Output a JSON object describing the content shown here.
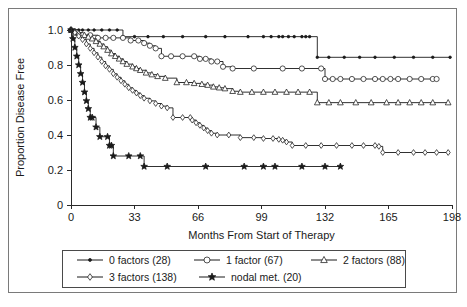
{
  "figure": {
    "name": "kaplan-meier-disease-free-survival",
    "frame_color": "#7a7a7a",
    "line_color": "#1a1a1a",
    "background": "#ffffff"
  },
  "chart_data": {
    "type": "line",
    "title": "",
    "subtitle": "",
    "xlabel": "Months From Start of Therapy",
    "ylabel": "Proportion Disease Free",
    "xlim": [
      0,
      198
    ],
    "ylim": [
      0,
      1.0
    ],
    "xticks": [
      0,
      33,
      66,
      99,
      132,
      165,
      198
    ],
    "xticklabels": [
      "0",
      "33",
      "66",
      "99",
      "132",
      "165",
      "198"
    ],
    "yticks": [
      0,
      0.2,
      0.4,
      0.6,
      0.8,
      1.0
    ],
    "yticklabels": [
      "0",
      "0.2",
      "0.4",
      "0.6",
      "0.8",
      "1.0"
    ],
    "grid": false,
    "legend_position": "below-axes",
    "step_style": "post",
    "series": [
      {
        "name": "0 factors (28)",
        "label": "0 factors",
        "n": 28,
        "marker": "dot",
        "marker_fill": "solid",
        "points": [
          [
            0,
            1.0
          ],
          [
            2,
            1.0
          ],
          [
            4,
            1.0
          ],
          [
            6,
            1.0
          ],
          [
            9,
            1.0
          ],
          [
            12,
            1.0
          ],
          [
            16,
            1.0
          ],
          [
            20,
            1.0
          ],
          [
            24,
            1.0
          ],
          [
            27,
            0.962
          ],
          [
            33,
            0.962
          ],
          [
            40,
            0.962
          ],
          [
            48,
            0.962
          ],
          [
            58,
            0.962
          ],
          [
            70,
            0.962
          ],
          [
            80,
            0.962
          ],
          [
            92,
            0.962
          ],
          [
            100,
            0.962
          ],
          [
            104,
            0.962
          ],
          [
            108,
            0.962
          ],
          [
            110,
            0.962
          ],
          [
            113,
            0.962
          ],
          [
            116,
            0.962
          ],
          [
            120,
            0.962
          ],
          [
            122,
            0.962
          ],
          [
            124,
            0.962
          ],
          [
            128,
            0.844
          ],
          [
            134,
            0.844
          ],
          [
            142,
            0.844
          ],
          [
            150,
            0.844
          ],
          [
            158,
            0.844
          ],
          [
            168,
            0.844
          ],
          [
            178,
            0.844
          ],
          [
            188,
            0.844
          ],
          [
            197,
            0.844
          ]
        ]
      },
      {
        "name": "1 factor (67)",
        "label": "1 factor",
        "n": 67,
        "marker": "circle",
        "marker_fill": "open",
        "points": [
          [
            0,
            1.0
          ],
          [
            3,
            0.985
          ],
          [
            6,
            0.97
          ],
          [
            10,
            0.97
          ],
          [
            14,
            0.955
          ],
          [
            18,
            0.955
          ],
          [
            22,
            0.955
          ],
          [
            27,
            0.955
          ],
          [
            31,
            0.94
          ],
          [
            35,
            0.94
          ],
          [
            38,
            0.925
          ],
          [
            41,
            0.91
          ],
          [
            44,
            0.895
          ],
          [
            47,
            0.85
          ],
          [
            52,
            0.85
          ],
          [
            58,
            0.85
          ],
          [
            64,
            0.85
          ],
          [
            67,
            0.835
          ],
          [
            70,
            0.835
          ],
          [
            73,
            0.82
          ],
          [
            76,
            0.82
          ],
          [
            79,
            0.79
          ],
          [
            84,
            0.78
          ],
          [
            95,
            0.78
          ],
          [
            110,
            0.78
          ],
          [
            120,
            0.78
          ],
          [
            130,
            0.78
          ],
          [
            132,
            0.72
          ],
          [
            136,
            0.72
          ],
          [
            140,
            0.72
          ],
          [
            146,
            0.72
          ],
          [
            152,
            0.72
          ],
          [
            158,
            0.72
          ],
          [
            162,
            0.72
          ],
          [
            166,
            0.72
          ],
          [
            170,
            0.72
          ],
          [
            176,
            0.72
          ],
          [
            182,
            0.72
          ],
          [
            188,
            0.72
          ],
          [
            190,
            0.72
          ]
        ]
      },
      {
        "name": "2 factors (88)",
        "label": "2 factors",
        "n": 88,
        "marker": "triangle",
        "marker_fill": "open",
        "points": [
          [
            0,
            1.0
          ],
          [
            2,
            0.99
          ],
          [
            4,
            0.98
          ],
          [
            7,
            0.97
          ],
          [
            9,
            0.96
          ],
          [
            11,
            0.95
          ],
          [
            13,
            0.935
          ],
          [
            15,
            0.92
          ],
          [
            17,
            0.905
          ],
          [
            19,
            0.885
          ],
          [
            21,
            0.865
          ],
          [
            23,
            0.85
          ],
          [
            25,
            0.835
          ],
          [
            27,
            0.82
          ],
          [
            29,
            0.805
          ],
          [
            32,
            0.79
          ],
          [
            34,
            0.78
          ],
          [
            36,
            0.77
          ],
          [
            39,
            0.755
          ],
          [
            42,
            0.745
          ],
          [
            45,
            0.735
          ],
          [
            49,
            0.725
          ],
          [
            55,
            0.7
          ],
          [
            60,
            0.7
          ],
          [
            64,
            0.695
          ],
          [
            68,
            0.69
          ],
          [
            71,
            0.685
          ],
          [
            74,
            0.675
          ],
          [
            77,
            0.67
          ],
          [
            80,
            0.665
          ],
          [
            84,
            0.65
          ],
          [
            88,
            0.645
          ],
          [
            94,
            0.645
          ],
          [
            100,
            0.645
          ],
          [
            106,
            0.645
          ],
          [
            112,
            0.645
          ],
          [
            118,
            0.645
          ],
          [
            124,
            0.645
          ],
          [
            128,
            0.585
          ],
          [
            134,
            0.585
          ],
          [
            140,
            0.585
          ],
          [
            148,
            0.585
          ],
          [
            156,
            0.585
          ],
          [
            164,
            0.585
          ],
          [
            170,
            0.585
          ],
          [
            176,
            0.585
          ],
          [
            182,
            0.585
          ],
          [
            188,
            0.585
          ],
          [
            196,
            0.585
          ]
        ]
      },
      {
        "name": "3 factors (138)",
        "label": "3 factors",
        "n": 138,
        "marker": "diamond",
        "marker_fill": "open",
        "points": [
          [
            0,
            1.0
          ],
          [
            2,
            0.985
          ],
          [
            4,
            0.965
          ],
          [
            6,
            0.945
          ],
          [
            8,
            0.92
          ],
          [
            10,
            0.895
          ],
          [
            12,
            0.87
          ],
          [
            14,
            0.845
          ],
          [
            16,
            0.82
          ],
          [
            18,
            0.795
          ],
          [
            20,
            0.775
          ],
          [
            22,
            0.75
          ],
          [
            24,
            0.73
          ],
          [
            26,
            0.71
          ],
          [
            28,
            0.69
          ],
          [
            30,
            0.67
          ],
          [
            32,
            0.655
          ],
          [
            34,
            0.64
          ],
          [
            36,
            0.625
          ],
          [
            38,
            0.61
          ],
          [
            41,
            0.595
          ],
          [
            44,
            0.58
          ],
          [
            47,
            0.565
          ],
          [
            50,
            0.555
          ],
          [
            53,
            0.5
          ],
          [
            58,
            0.5
          ],
          [
            62,
            0.5
          ],
          [
            63,
            0.485
          ],
          [
            65,
            0.47
          ],
          [
            67,
            0.455
          ],
          [
            69,
            0.44
          ],
          [
            71,
            0.425
          ],
          [
            73,
            0.41
          ],
          [
            76,
            0.4
          ],
          [
            82,
            0.4
          ],
          [
            88,
            0.385
          ],
          [
            95,
            0.385
          ],
          [
            100,
            0.38
          ],
          [
            105,
            0.38
          ],
          [
            108,
            0.375
          ],
          [
            110,
            0.37
          ],
          [
            112,
            0.36
          ],
          [
            115,
            0.34
          ],
          [
            122,
            0.34
          ],
          [
            130,
            0.34
          ],
          [
            138,
            0.34
          ],
          [
            146,
            0.34
          ],
          [
            152,
            0.34
          ],
          [
            158,
            0.34
          ],
          [
            160,
            0.335
          ],
          [
            162,
            0.3
          ],
          [
            170,
            0.3
          ],
          [
            178,
            0.3
          ],
          [
            184,
            0.3
          ],
          [
            190,
            0.3
          ],
          [
            196,
            0.3
          ]
        ]
      },
      {
        "name": "nodal met. (20)",
        "label": "nodal met.",
        "n": 20,
        "marker": "star",
        "marker_fill": "solid",
        "points": [
          [
            0,
            1.0
          ],
          [
            1,
            0.95
          ],
          [
            2,
            0.9
          ],
          [
            3,
            0.85
          ],
          [
            4,
            0.8
          ],
          [
            5,
            0.75
          ],
          [
            6,
            0.7
          ],
          [
            7,
            0.645
          ],
          [
            8,
            0.595
          ],
          [
            9,
            0.55
          ],
          [
            10,
            0.5
          ],
          [
            11,
            0.5
          ],
          [
            13,
            0.445
          ],
          [
            15,
            0.39
          ],
          [
            19,
            0.39
          ],
          [
            20,
            0.34
          ],
          [
            21,
            0.34
          ],
          [
            22,
            0.28
          ],
          [
            30,
            0.28
          ],
          [
            36,
            0.28
          ],
          [
            38,
            0.22
          ],
          [
            50,
            0.22
          ],
          [
            70,
            0.22
          ],
          [
            90,
            0.22
          ],
          [
            100,
            0.22
          ],
          [
            106,
            0.22
          ],
          [
            120,
            0.22
          ],
          [
            132,
            0.22
          ],
          [
            140,
            0.22
          ]
        ]
      }
    ]
  },
  "legend": {
    "rows": [
      [
        {
          "label": "0 factors (28)",
          "marker": "dot",
          "fill": "solid"
        },
        {
          "label": "1 factor (67)",
          "marker": "circle",
          "fill": "open"
        },
        {
          "label": "2 factors (88)",
          "marker": "triangle",
          "fill": "open"
        }
      ],
      [
        {
          "label": "3 factors (138)",
          "marker": "diamond",
          "fill": "open"
        },
        {
          "label": "nodal met. (20)",
          "marker": "star",
          "fill": "solid"
        }
      ]
    ]
  }
}
